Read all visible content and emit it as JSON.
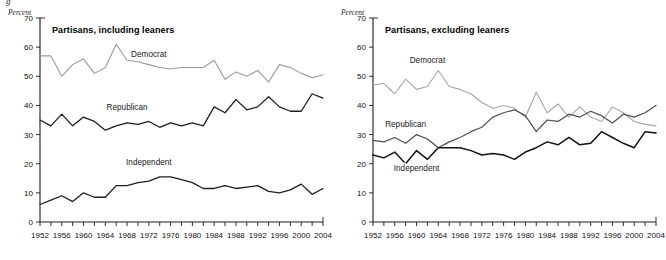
{
  "figure": {
    "cropped_caption_fragment": "g",
    "panels": [
      {
        "key": "including",
        "unit_label": "Percent",
        "title": "Partisans, including leaners"
      },
      {
        "key": "excluding",
        "unit_label": "Percent",
        "title": "Partisans, excluding leaners"
      }
    ]
  },
  "chart_data": [
    {
      "type": "line",
      "title": "Partisans, including leaners",
      "xlabel": "",
      "ylabel": "Percent",
      "ylim": [
        0,
        70
      ],
      "ytick_labels": [
        "0",
        "10",
        "20",
        "30",
        "40",
        "50",
        "60",
        "70"
      ],
      "ytick_values": [
        0,
        10,
        20,
        30,
        40,
        50,
        60,
        70
      ],
      "xlim": [
        1952,
        2004
      ],
      "x": [
        1952,
        1954,
        1956,
        1958,
        1960,
        1962,
        1964,
        1966,
        1968,
        1970,
        1972,
        1974,
        1976,
        1978,
        1980,
        1982,
        1984,
        1986,
        1988,
        1990,
        1992,
        1994,
        1996,
        1998,
        2000,
        2002,
        2004
      ],
      "xtick_labels": [
        "1952",
        "1956",
        "1960",
        "1964",
        "1968",
        "1972",
        "1976",
        "1980",
        "1984",
        "1988",
        "1992",
        "1996",
        "2000",
        "2004"
      ],
      "xtick_label_values": [
        1952,
        1956,
        1960,
        1964,
        1968,
        1972,
        1976,
        1980,
        1984,
        1988,
        1992,
        1996,
        2000,
        2004
      ],
      "minor_tick_step": 2,
      "grid": false,
      "legend": "inline-labels",
      "series": [
        {
          "name": "Democrat",
          "color": "#9a9a9a",
          "width": 1.1,
          "label_x": 1972,
          "label_y": 56.5,
          "values": [
            57,
            57,
            50,
            54,
            56,
            51,
            53,
            61,
            55.5,
            55,
            54,
            53,
            52.5,
            53,
            53,
            53,
            55.5,
            49,
            51.5,
            50,
            52,
            48,
            54,
            53,
            51,
            49.5,
            50.5
          ]
        },
        {
          "name": "Republican",
          "color": "#1f1f1f",
          "width": 1.3,
          "label_x": 1968,
          "label_y": 38.5,
          "values": [
            35,
            33,
            37,
            33,
            36,
            34.5,
            31.5,
            33,
            34,
            33.5,
            34.5,
            32.5,
            34,
            33,
            34,
            33,
            39.5,
            37.5,
            42,
            38.5,
            39.5,
            43,
            39.5,
            38,
            38,
            44,
            42.5
          ]
        },
        {
          "name": "Independent",
          "color": "#1f1f1f",
          "width": 1.3,
          "label_x": 1972,
          "label_y": 19.5,
          "values": [
            6,
            7.5,
            9,
            7,
            10,
            8.5,
            8.5,
            12.5,
            12.5,
            13.5,
            14,
            15.5,
            15.5,
            14.5,
            13.5,
            11.5,
            11.5,
            12.5,
            11.5,
            12,
            12.5,
            10.5,
            10,
            11,
            13,
            9.5,
            11.5
          ]
        }
      ]
    },
    {
      "type": "line",
      "title": "Partisans, excluding leaners",
      "xlabel": "",
      "ylabel": "Percent",
      "ylim": [
        0,
        70
      ],
      "ytick_labels": [
        "0",
        "10",
        "20",
        "30",
        "40",
        "50",
        "60",
        "70"
      ],
      "ytick_values": [
        0,
        10,
        20,
        30,
        40,
        50,
        60,
        70
      ],
      "xlim": [
        1952,
        2004
      ],
      "x": [
        1952,
        1954,
        1956,
        1958,
        1960,
        1962,
        1964,
        1966,
        1968,
        1970,
        1972,
        1974,
        1976,
        1978,
        1980,
        1982,
        1984,
        1986,
        1988,
        1990,
        1992,
        1994,
        1996,
        1998,
        2000,
        2002,
        2004
      ],
      "xtick_labels": [
        "1952",
        "1956",
        "1960",
        "1964",
        "1968",
        "1972",
        "1976",
        "1980",
        "1984",
        "1988",
        "1992",
        "1996",
        "2000",
        "2004"
      ],
      "xtick_label_values": [
        1952,
        1956,
        1960,
        1964,
        1968,
        1972,
        1976,
        1980,
        1984,
        1988,
        1992,
        1996,
        2000,
        2004
      ],
      "minor_tick_step": 2,
      "grid": false,
      "legend": "inline-labels",
      "series": [
        {
          "name": "Democrat",
          "color": "#a6a6a6",
          "width": 1.1,
          "label_x": 1962,
          "label_y": 54.5,
          "values": [
            47,
            47.5,
            44,
            49,
            45.5,
            46.5,
            52,
            46.5,
            45.5,
            44,
            41,
            39,
            40,
            39,
            36,
            44.5,
            37.5,
            40.5,
            36,
            39.5,
            36,
            34.5,
            39.5,
            37.5,
            34.5,
            33.5,
            33
          ]
        },
        {
          "name": "Republican",
          "color": "#4f4f4f",
          "width": 1.2,
          "label_x": 1958,
          "label_y": 32.5,
          "values": [
            28,
            27.5,
            29,
            27,
            30,
            28.5,
            25.5,
            27.5,
            29,
            31,
            32.5,
            36,
            37.5,
            38.5,
            36.5,
            31,
            35,
            34.5,
            37,
            36,
            38,
            36.5,
            34,
            37,
            36,
            37.5,
            40
          ]
        },
        {
          "name": "Independent",
          "color": "#131313",
          "width": 1.5,
          "label_x": 1960,
          "label_y": 17.5,
          "values": [
            23,
            22,
            24,
            20,
            24.5,
            21.5,
            25.5,
            25.5,
            25.5,
            24.5,
            23,
            23.5,
            23,
            21.5,
            24,
            25.5,
            27.5,
            26.5,
            29,
            26.5,
            27,
            31,
            29,
            27,
            25.5,
            31,
            30.5
          ]
        }
      ]
    }
  ]
}
